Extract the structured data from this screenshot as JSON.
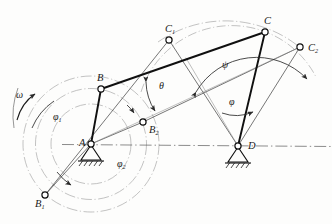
{
  "figure": {
    "type": "kinematic-linkage-diagram",
    "background_color": "#fdfdfc",
    "line_color": "#1a1a1a",
    "thin_line_color": "#5a5a5a",
    "light_line_color": "#9a9a9a"
  },
  "joints": [
    {
      "id": "A",
      "label": "A",
      "sub": "",
      "x": 91,
      "y": 144,
      "kind": "fixed-pivot",
      "label_dx": -12,
      "label_dy": 2
    },
    {
      "id": "D",
      "label": "D",
      "sub": "",
      "x": 238,
      "y": 146,
      "kind": "fixed-pivot",
      "label_dx": 10,
      "label_dy": 3
    },
    {
      "id": "B",
      "label": "B",
      "sub": "",
      "x": 101,
      "y": 89,
      "kind": "moving-pivot",
      "label_dx": -4,
      "label_dy": -8
    },
    {
      "id": "C",
      "label": "C",
      "sub": "",
      "x": 265,
      "y": 32,
      "kind": "moving-pivot",
      "label_dx": -1,
      "label_dy": -8
    },
    {
      "id": "B1",
      "label": "B",
      "sub": "1",
      "x": 45,
      "y": 195,
      "kind": "moving-pivot",
      "label_dx": -10,
      "label_dy": 12
    },
    {
      "id": "B2",
      "label": "B",
      "sub": "2",
      "x": 143,
      "y": 122,
      "kind": "moving-pivot",
      "label_dx": 6,
      "label_dy": 11
    },
    {
      "id": "C1",
      "label": "C",
      "sub": "1",
      "x": 169,
      "y": 40,
      "kind": "moving-pivot",
      "label_dx": -4,
      "label_dy": -8
    },
    {
      "id": "C2",
      "label": "C",
      "sub": "2",
      "x": 300,
      "y": 47,
      "kind": "moving-pivot",
      "label_dx": 8,
      "label_dy": 4
    }
  ],
  "angles": [
    {
      "id": "theta",
      "label": "θ",
      "x": 159,
      "y": 89
    },
    {
      "id": "psi",
      "label": "ψ",
      "x": 222,
      "y": 68
    },
    {
      "id": "phi",
      "label": "φ",
      "x": 229,
      "y": 105
    },
    {
      "id": "phi1",
      "label": "φ",
      "sub": "1",
      "x": 53,
      "y": 120
    },
    {
      "id": "phi2",
      "label": "φ",
      "sub": "2",
      "x": 117,
      "y": 167
    }
  ],
  "omega": {
    "label": "ω",
    "x": 16,
    "y": 98
  },
  "links": [
    {
      "name": "crank-AB",
      "from": "A",
      "to": "B",
      "weight": "heavy"
    },
    {
      "name": "coupler-BC",
      "from": "B",
      "to": "C",
      "weight": "heavy"
    },
    {
      "name": "rocker-CD",
      "from": "C",
      "to": "D",
      "weight": "heavy"
    },
    {
      "name": "crank-AB2",
      "from": "A",
      "to": "B2",
      "weight": "light"
    },
    {
      "name": "crank-AB1",
      "from": "A",
      "to": "B1",
      "weight": "light"
    },
    {
      "name": "coupler-B2C2",
      "from": "B2",
      "to": "C2",
      "weight": "light"
    },
    {
      "name": "coupler-B1C1",
      "from": "B1",
      "to": "C1",
      "weight": "light"
    },
    {
      "name": "rocker-C1D",
      "from": "C1",
      "to": "D",
      "weight": "light"
    },
    {
      "name": "rocker-C2D",
      "from": "C2",
      "to": "D",
      "weight": "light"
    },
    {
      "name": "ground-AD",
      "from": "A",
      "to": "D",
      "weight": "dashdot"
    }
  ]
}
